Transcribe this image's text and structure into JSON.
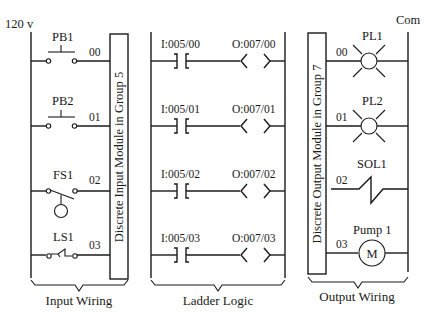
{
  "input_wiring": {
    "supply_label": "120 v",
    "caption": "Input Wiring",
    "module_label": "Discrete Input Module in Group 5",
    "devices": [
      {
        "name": "PB1",
        "terminal": "00",
        "type": "pushbutton-no"
      },
      {
        "name": "PB2",
        "terminal": "01",
        "type": "pushbutton-no"
      },
      {
        "name": "FS1",
        "terminal": "02",
        "type": "float-switch"
      },
      {
        "name": "LS1",
        "terminal": "03",
        "type": "limit-switch"
      }
    ]
  },
  "ladder_logic": {
    "caption": "Ladder Logic",
    "rungs": [
      {
        "input": "I:005/00",
        "output": "O:007/00"
      },
      {
        "input": "I:005/01",
        "output": "O:007/01"
      },
      {
        "input": "I:005/02",
        "output": "O:007/02"
      },
      {
        "input": "I:005/03",
        "output": "O:007/03"
      }
    ]
  },
  "output_wiring": {
    "common_label": "Com",
    "caption": "Output Wiring",
    "module_label": "Discrete Output Module in Group 7",
    "devices": [
      {
        "name": "PL1",
        "terminal": "00",
        "type": "pilot-light"
      },
      {
        "name": "PL2",
        "terminal": "01",
        "type": "pilot-light"
      },
      {
        "name": "SOL1",
        "terminal": "02",
        "type": "solenoid"
      },
      {
        "name": "Pump 1",
        "terminal": "03",
        "type": "motor",
        "symbol": "M"
      }
    ]
  }
}
